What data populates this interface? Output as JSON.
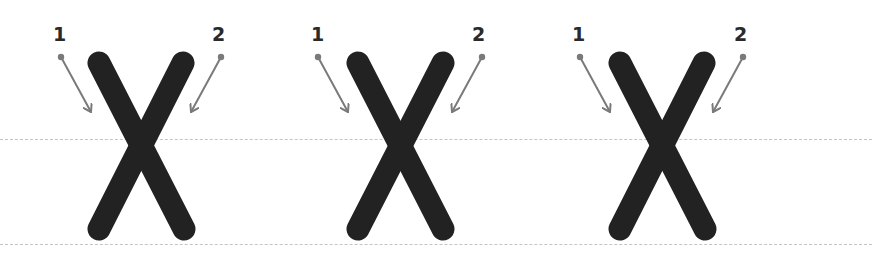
{
  "worksheet": {
    "letter": "X",
    "guide_lines": [
      {
        "name": "midline",
        "y": 139
      },
      {
        "name": "baseline",
        "y": 244
      }
    ],
    "colors": {
      "stroke": "#222222",
      "arrow": "#7a7a7a",
      "guide": "#c4c4c4",
      "label": "#2a2a2a"
    },
    "letters": [
      {
        "strokes": [
          {
            "order": "1",
            "x1": 99,
            "y1": 63,
            "x2": 184,
            "y2": 229
          },
          {
            "order": "2",
            "x1": 183,
            "y1": 63,
            "x2": 99,
            "y2": 229
          }
        ],
        "labels": [
          {
            "text": "1",
            "x": 53,
            "y": 25
          },
          {
            "text": "2",
            "x": 212,
            "y": 25
          }
        ],
        "arrows": [
          {
            "x1": 61,
            "y1": 57,
            "x2": 91,
            "y2": 112
          },
          {
            "x1": 221,
            "y1": 57,
            "x2": 191,
            "y2": 112
          }
        ]
      },
      {
        "strokes": [
          {
            "order": "1",
            "x1": 358,
            "y1": 63,
            "x2": 443,
            "y2": 229
          },
          {
            "order": "2",
            "x1": 443,
            "y1": 63,
            "x2": 358,
            "y2": 229
          }
        ],
        "labels": [
          {
            "text": "1",
            "x": 311,
            "y": 25
          },
          {
            "text": "2",
            "x": 472,
            "y": 25
          }
        ],
        "arrows": [
          {
            "x1": 318,
            "y1": 57,
            "x2": 348,
            "y2": 112
          },
          {
            "x1": 482,
            "y1": 57,
            "x2": 452,
            "y2": 112
          }
        ]
      },
      {
        "strokes": [
          {
            "order": "1",
            "x1": 620,
            "y1": 63,
            "x2": 705,
            "y2": 229
          },
          {
            "order": "2",
            "x1": 704,
            "y1": 63,
            "x2": 620,
            "y2": 229
          }
        ],
        "labels": [
          {
            "text": "1",
            "x": 572,
            "y": 25
          },
          {
            "text": "2",
            "x": 734,
            "y": 25
          }
        ],
        "arrows": [
          {
            "x1": 580,
            "y1": 57,
            "x2": 610,
            "y2": 112
          },
          {
            "x1": 743,
            "y1": 57,
            "x2": 713,
            "y2": 112
          }
        ]
      }
    ]
  }
}
